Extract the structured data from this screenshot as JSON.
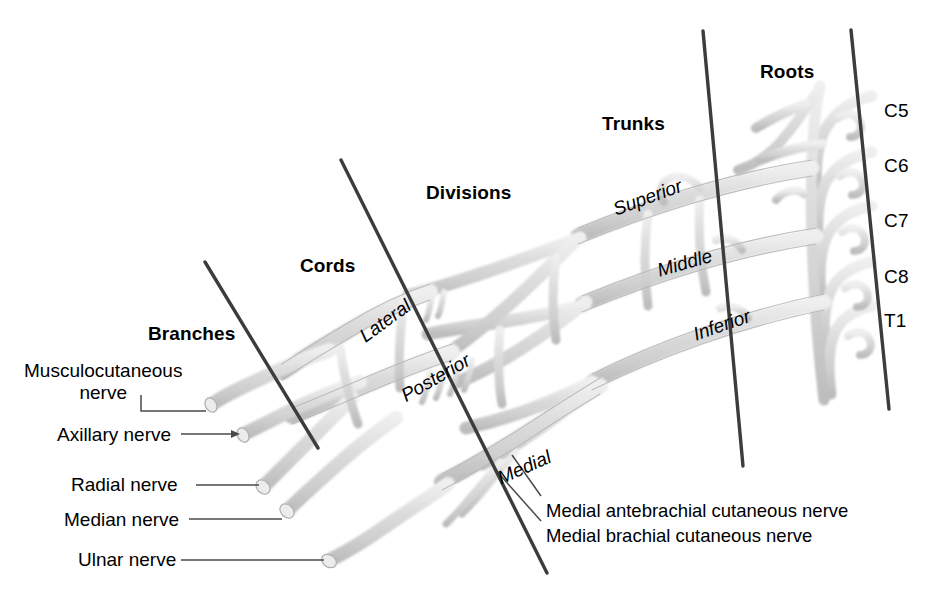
{
  "figure": {
    "background_color": "#ffffff",
    "nerve_fill_color": "#d9d9d9",
    "nerve_edge_color": "#a8a8a8",
    "divider_color": "#3c3c3c",
    "leader_color": "#555555",
    "text_color": "#000000"
  },
  "sections": [
    {
      "id": "branches",
      "label": "Branches",
      "x": 148,
      "y": 323
    },
    {
      "id": "cords",
      "label": "Cords",
      "x": 300,
      "y": 255
    },
    {
      "id": "divisions",
      "label": "Divisions",
      "x": 426,
      "y": 182
    },
    {
      "id": "trunks",
      "label": "Trunks",
      "x": 602,
      "y": 113
    },
    {
      "id": "roots",
      "label": "Roots",
      "x": 760,
      "y": 61
    }
  ],
  "roots": [
    {
      "label": "C5",
      "x": 884,
      "y": 100
    },
    {
      "label": "C6",
      "x": 884,
      "y": 155
    },
    {
      "label": "C7",
      "x": 884,
      "y": 210
    },
    {
      "label": "C8",
      "x": 884,
      "y": 266
    },
    {
      "label": "T1",
      "x": 884,
      "y": 310
    }
  ],
  "trunks": [
    {
      "label": "Superior",
      "x": 614,
      "y": 199,
      "rotate": -20
    },
    {
      "label": "Middle",
      "x": 658,
      "y": 260,
      "rotate": -16
    },
    {
      "label": "Inferior",
      "x": 694,
      "y": 324,
      "rotate": -19
    }
  ],
  "cords": [
    {
      "label": "Lateral",
      "x": 362,
      "y": 327,
      "rotate": -36
    },
    {
      "label": "Posterior",
      "x": 403,
      "y": 386,
      "rotate": -30
    },
    {
      "label": "Medial",
      "x": 499,
      "y": 468,
      "rotate": -24
    }
  ],
  "branches": [
    {
      "id": "musculocutaneous",
      "line1": "Musculocutaneous",
      "line2": "nerve",
      "x": 24,
      "y": 360
    },
    {
      "id": "axillary",
      "line1": "Axillary nerve",
      "line2": "",
      "x": 57,
      "y": 424
    },
    {
      "id": "radial",
      "line1": "Radial nerve",
      "line2": "",
      "x": 71,
      "y": 474
    },
    {
      "id": "median",
      "line1": "Median nerve",
      "line2": "",
      "x": 64,
      "y": 509
    },
    {
      "id": "ulnar",
      "line1": "Ulnar nerve",
      "line2": "",
      "x": 78,
      "y": 549
    }
  ],
  "medial_branches": [
    {
      "id": "medial-antebrachial-cutaneous",
      "label": "Medial antebrachial cutaneous nerve",
      "x": 546,
      "y": 500
    },
    {
      "id": "medial-brachial-cutaneous",
      "label": "Medial brachial cutaneous nerve",
      "x": 546,
      "y": 525
    }
  ],
  "dividers": [
    {
      "id": "branches-cords",
      "x1": 205,
      "y1": 262,
      "x2": 318,
      "y2": 448
    },
    {
      "id": "cords-divisions",
      "x1": 341,
      "y1": 160,
      "x2": 547,
      "y2": 573
    },
    {
      "id": "divisions-trunks",
      "x1": 703,
      "y1": 31,
      "x2": 743,
      "y2": 466
    },
    {
      "id": "trunks-roots",
      "x1": 851,
      "y1": 30,
      "x2": 889,
      "y2": 409
    }
  ]
}
